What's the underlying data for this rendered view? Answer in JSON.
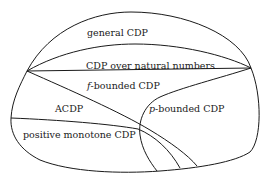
{
  "diagram": {
    "type": "nested-region-diagram",
    "regions": [
      {
        "id": "general",
        "label": "general CDP"
      },
      {
        "id": "natural",
        "label": "CDP over natural numbers"
      },
      {
        "id": "fbounded",
        "label_prefix": "f",
        "label_suffix": "-bounded CDP"
      },
      {
        "id": "acdp",
        "label": "ACDP"
      },
      {
        "id": "pbounded",
        "label_prefix": "p",
        "label_suffix": "-bounded CDP"
      },
      {
        "id": "posmono",
        "label": "positive monotone CDP"
      }
    ],
    "stroke_color": "#1a1a1a",
    "background": "#ffffff"
  }
}
